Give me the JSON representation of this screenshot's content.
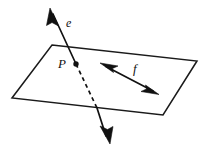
{
  "figure": {
    "type": "geometry-diagram",
    "background_color": "#ffffff",
    "ink_color": "#111111",
    "labels": {
      "line_e": "e",
      "point_p": "P",
      "line_f": "f"
    },
    "elements": {
      "plane": {
        "name": "plane",
        "shape": "parallelogram",
        "points": "52,45 197,61 163,115 12,98"
      },
      "line_e": {
        "name": "line-e",
        "style": "solid-above-plane, dashed-inside-plane, solid-below-plane, double-arrow",
        "upper_solid": "53,14 76,64",
        "dashed": "76,64 97,108",
        "lower_solid": "97,108 106,136",
        "arrow_top": "50,8 58,25 51,22 46,25",
        "arrow_bottom": "109,143 100,126 108,129 113,126"
      },
      "line_f": {
        "name": "line-f",
        "style": "double-headed arrow in plane",
        "segment": "106,66 153,91",
        "arrow_start": "101,63 119,66 113,69 115,73",
        "arrow_end": "158,94 140,91 146,88 144,84"
      },
      "point_p": {
        "name": "point-p",
        "cx": 76,
        "cy": 64,
        "r": 2.6
      },
      "label_e_pos": {
        "x": 66,
        "y": 27
      },
      "label_p_pos": {
        "x": 59,
        "y": 68
      },
      "label_f_pos": {
        "x": 133,
        "y": 73
      }
    }
  }
}
